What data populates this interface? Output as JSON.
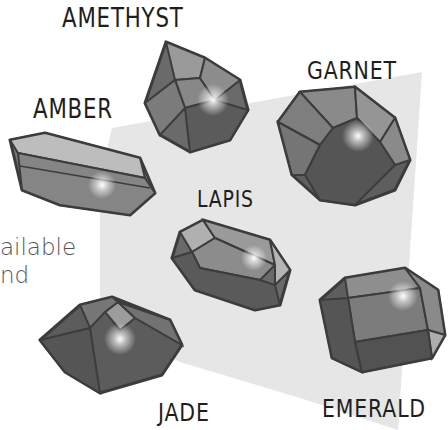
{
  "illustration": {
    "subject": "gemstones",
    "colors": {
      "background": "#ffffff",
      "panel": "#e6e6e6",
      "gem_dark": "#5a5a5a",
      "gem_mid": "#7a7a7a",
      "gem_light": "#a8a8a8",
      "outline": "#3c3c3c",
      "label": "#1e1e1e",
      "side_text": "#555555"
    },
    "gems": [
      {
        "name": "amethyst",
        "label": "AMETHYST"
      },
      {
        "name": "amber",
        "label": "AMBER"
      },
      {
        "name": "garnet",
        "label": "GARNET"
      },
      {
        "name": "lapis",
        "label": "LAPIS"
      },
      {
        "name": "jade",
        "label": "JADE"
      },
      {
        "name": "emerald",
        "label": "EMERALD"
      }
    ]
  },
  "side_text": {
    "line1": "ailable",
    "line2": "nd"
  }
}
